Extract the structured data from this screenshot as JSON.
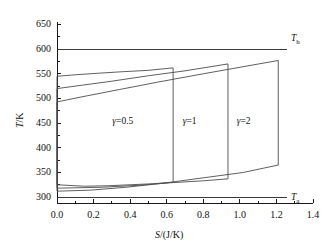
{
  "chart_data": {
    "type": "line",
    "title": "",
    "xlabel": "S/(J/K)",
    "ylabel": "T/K",
    "xlim": [
      0.0,
      1.4
    ],
    "ylim": [
      288,
      655
    ],
    "grid": false,
    "legend": "none",
    "xticks": [
      "0.0",
      "0.2",
      "0.4",
      "0.6",
      "0.8",
      "1.0",
      "1.2",
      "1.4"
    ],
    "xtick_values": [
      0.0,
      0.2,
      0.4,
      0.6,
      0.8,
      1.0,
      1.2,
      1.4
    ],
    "yticks": [
      "300",
      "350",
      "400",
      "450",
      "500",
      "550",
      "600",
      "650"
    ],
    "ytick_values": [
      300,
      350,
      400,
      450,
      500,
      550,
      600,
      650
    ],
    "reference_lines": [
      {
        "name": "T_h",
        "label_html": "T<sub>h</sub>",
        "value": 600,
        "orientation": "horizontal"
      },
      {
        "name": "T_a",
        "label_html": "T<sub>a</sub>",
        "value": 300,
        "orientation": "horizontal"
      }
    ],
    "series": [
      {
        "name": "gamma=0.5",
        "label": "γ=0.5",
        "label_point": {
          "x": 0.39,
          "y": 452
        },
        "points": [
          [
            0.0,
            545
          ],
          [
            0.1,
            548
          ],
          [
            0.22,
            551
          ],
          [
            0.35,
            554
          ],
          [
            0.5,
            557
          ],
          [
            0.635,
            562
          ],
          [
            0.635,
            330
          ],
          [
            0.52,
            327
          ],
          [
            0.4,
            325
          ],
          [
            0.28,
            323
          ],
          [
            0.15,
            322
          ],
          [
            0.0,
            325
          ],
          [
            0.0,
            545
          ]
        ]
      },
      {
        "name": "gamma=1",
        "label": "γ=1",
        "label_point": {
          "x": 0.775,
          "y": 452
        },
        "points": [
          [
            0.0,
            520
          ],
          [
            0.14,
            527
          ],
          [
            0.3,
            535
          ],
          [
            0.5,
            546
          ],
          [
            0.7,
            556
          ],
          [
            0.935,
            570
          ],
          [
            0.935,
            337
          ],
          [
            0.8,
            333
          ],
          [
            0.62,
            329
          ],
          [
            0.45,
            324
          ],
          [
            0.25,
            320
          ],
          [
            0.0,
            318
          ],
          [
            0.0,
            520
          ]
        ]
      },
      {
        "name": "gamma=2",
        "label": "γ=2",
        "label_point": {
          "x": 1.07,
          "y": 452
        },
        "points": [
          [
            0.0,
            493
          ],
          [
            0.16,
            505
          ],
          [
            0.34,
            518
          ],
          [
            0.55,
            533
          ],
          [
            0.8,
            550
          ],
          [
            1.21,
            577
          ],
          [
            1.21,
            365
          ],
          [
            1.02,
            350
          ],
          [
            0.82,
            340
          ],
          [
            0.6,
            329
          ],
          [
            0.38,
            320
          ],
          [
            0.18,
            314
          ],
          [
            0.0,
            312
          ],
          [
            0.0,
            493
          ]
        ]
      }
    ],
    "colors": {
      "axis": "#1a1a1a",
      "curve": "#4d4d4d",
      "reference": "#3a3a3a",
      "text": "#111111"
    }
  }
}
